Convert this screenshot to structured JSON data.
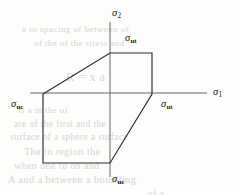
{
  "figure": {
    "kind": "stress-space-failure-envelope",
    "background_color": "#fdfdfc",
    "line_color": "#2b2b2b",
    "axis_color": "#555555",
    "label_color": "#1b1b1b",
    "ghost_color": "#c9c7c2",
    "width": 237,
    "height": 195
  },
  "axes": {
    "origin": {
      "x": 110,
      "y": 93
    },
    "horizontal": {
      "name": "sigma-1-axis",
      "x_start": 30,
      "x_end": 207,
      "y": 93,
      "label_symbol": "σ",
      "label_subscript": "1",
      "label_x": 213,
      "label_y": 87
    },
    "vertical": {
      "name": "sigma-2-axis",
      "y_start": 22,
      "y_end": 177,
      "x": 110,
      "label_symbol": "σ",
      "label_subscript": "2",
      "label_x": 112,
      "label_y": 8
    }
  },
  "envelope": {
    "name": "failure-envelope-polygon",
    "stroke_width": 1.15,
    "fill": "none",
    "vertices": [
      {
        "x": 43,
        "y": 94,
        "note": "sigma-uc on sigma-1 axis (left)"
      },
      {
        "x": 110,
        "y": 53,
        "note": "sigma-ut on sigma-2 axis (top)"
      },
      {
        "x": 152,
        "y": 53,
        "note": "top-right corner"
      },
      {
        "x": 152,
        "y": 94,
        "note": "sigma-ut on sigma-1 axis (right)"
      },
      {
        "x": 110,
        "y": 163,
        "note": "sigma-uc on sigma-2 axis (bottom)"
      },
      {
        "x": 43,
        "y": 163,
        "note": "bottom-left corner"
      }
    ],
    "points_string": "43,94 110,53 152,53 152,94 110,163 43,163"
  },
  "annotations": [
    {
      "name": "sigma-ut-top-label",
      "symbol": "σ",
      "subscript": "ut",
      "x": 125,
      "y": 33,
      "meaning": "ultimate tensile strength along sigma-2"
    },
    {
      "name": "sigma-ut-right-label",
      "symbol": "σ",
      "subscript": "ut",
      "x": 161,
      "y": 99,
      "meaning": "ultimate tensile strength along sigma-1"
    },
    {
      "name": "sigma-uc-left-label",
      "symbol": "σ",
      "subscript": "uc",
      "x": 11,
      "y": 99,
      "meaning": "ultimate compressive strength along sigma-1"
    },
    {
      "name": "sigma-uc-bottom-label",
      "symbol": "σ",
      "subscript": "uc",
      "x": 112,
      "y": 174,
      "meaning": "ultimate compressive strength along sigma-2"
    }
  ],
  "ghost_text": {
    "note": "faint show-through text from the reverse side of the scanned page",
    "lines": [
      {
        "text": "a    to   spacing   of   between   of",
        "x": 22,
        "y": 24,
        "size": 9.2
      },
      {
        "text": "of   the   of   the   stress   and",
        "x": 34,
        "y": 38,
        "size": 9.0
      },
      {
        "text": "R  =  x  a",
        "x": 66,
        "y": 70,
        "size": 12.5
      },
      {
        "text": "is   a   in   the   of",
        "x": 18,
        "y": 105,
        "size": 9.0
      },
      {
        "text": "are   of   the   first   and   the",
        "x": 14,
        "y": 119,
        "size": 9.4
      },
      {
        "text": "surface   of   a   sphere   a   surface",
        "x": 10,
        "y": 132,
        "size": 9.4
      },
      {
        "text": "The   in   region   the",
        "x": 24,
        "y": 146,
        "size": 10.2
      },
      {
        "text": "when   one   to   on   and",
        "x": 14,
        "y": 160,
        "size": 10.0
      },
      {
        "text": "A   and   a   between   a   bounding",
        "x": 8,
        "y": 174,
        "size": 10.4
      },
      {
        "text": "of   a",
        "x": 148,
        "y": 188,
        "size": 9.6
      }
    ]
  }
}
